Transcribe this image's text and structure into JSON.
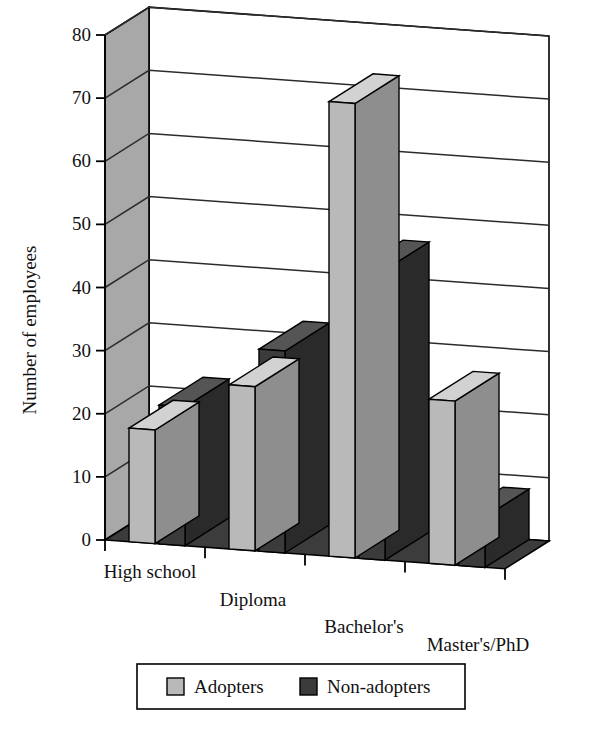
{
  "chart_data": {
    "type": "bar",
    "title": "",
    "xlabel": "",
    "ylabel": "Number of employees",
    "categories": [
      "High school",
      "Diploma",
      "Bachelor's",
      "Master's/PhD"
    ],
    "series": [
      {
        "name": "Adopters",
        "color": "#b9b9b9",
        "values": [
          18,
          26,
          72,
          26
        ]
      },
      {
        "name": "Non-adopters",
        "color": "#3b3b3b",
        "values": [
          22,
          32,
          46,
          8
        ]
      }
    ],
    "ylim": [
      0,
      80
    ],
    "yticks": [
      0,
      10,
      20,
      30,
      40,
      50,
      60,
      70,
      80
    ],
    "ytick_labels": [
      "0",
      "10",
      "20",
      "30",
      "40",
      "50",
      "60",
      "70",
      "80"
    ],
    "grid": true,
    "three_d": true,
    "legend_position": "bottom"
  },
  "legend": {
    "entries": [
      {
        "label": "Adopters",
        "swatch": "light-gray"
      },
      {
        "label": "Non-adopters",
        "swatch": "dark-gray"
      }
    ]
  },
  "colors": {
    "adopters_fill": "#b9b9b9",
    "adopters_side": "#8e8e8e",
    "adopters_top": "#d2d2d2",
    "nonadopters_fill": "#3b3b3b",
    "nonadopters_side": "#2a2a2a",
    "nonadopters_top": "#555555",
    "wall_left": "#a8a8a8",
    "wall_back": "#ffffff",
    "floor": "#3c3c3c",
    "outline": "#000000"
  }
}
